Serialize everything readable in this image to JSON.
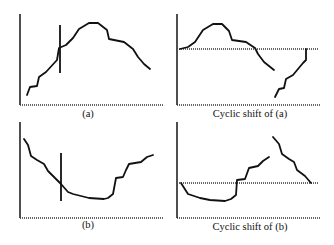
{
  "figure": {
    "panels": [
      {
        "id": "a",
        "caption": "(a)",
        "axes": {
          "x0": 20,
          "y_top": 14,
          "y_bottom": 105,
          "x_end": 163
        },
        "curves": [
          [
            [
              27,
              95
            ],
            [
              30,
              87
            ],
            [
              37,
              86
            ],
            [
              39,
              77
            ],
            [
              46,
              72
            ],
            [
              57,
              60
            ],
            [
              59,
              48
            ],
            [
              66,
              45
            ],
            [
              73,
              38
            ],
            [
              79,
              29
            ],
            [
              89,
              23
            ],
            [
              98,
              23
            ],
            [
              107,
              30
            ],
            [
              109,
              39
            ],
            [
              124,
              42
            ],
            [
              133,
              49
            ],
            [
              138,
              57
            ],
            [
              144,
              64
            ],
            [
              150,
              69
            ]
          ]
        ],
        "marker": {
          "x": 60,
          "y1": 25,
          "y2": 73
        },
        "reference_line": null,
        "caption_pos": {
          "x": 88,
          "y": 117
        }
      },
      {
        "id": "shift_a",
        "caption": "Cyclic shift of (a)",
        "axes": {
          "x0": 177,
          "y_top": 14,
          "y_bottom": 105,
          "x_end": 320
        },
        "curves": [
          [
            [
              180,
              49
            ],
            [
              188,
              47
            ],
            [
              195,
              42
            ],
            [
              203,
              30
            ],
            [
              213,
              24
            ],
            [
              222,
              24
            ],
            [
              229,
              31
            ],
            [
              232,
              40
            ],
            [
              246,
              42
            ],
            [
              255,
              48
            ],
            [
              258,
              54
            ],
            [
              264,
              62
            ],
            [
              274,
              70
            ]
          ],
          [
            [
              275,
              97
            ],
            [
              279,
              89
            ],
            [
              284,
              88
            ],
            [
              286,
              79
            ],
            [
              293,
              75
            ],
            [
              303,
              63
            ],
            [
              306,
              60
            ],
            [
              306,
              49
            ]
          ]
        ],
        "marker": null,
        "reference_line": {
          "y": 49,
          "x1": 179,
          "x2": 318
        },
        "caption_pos": {
          "x": 250,
          "y": 117
        }
      },
      {
        "id": "b",
        "caption": "(b)",
        "axes": {
          "x0": 20,
          "y_top": 122,
          "y_bottom": 218,
          "x_end": 163
        },
        "curves": [
          [
            [
              24,
              139
            ],
            [
              28,
              145
            ],
            [
              31,
              156
            ],
            [
              37,
              160
            ],
            [
              44,
              164
            ],
            [
              48,
              171
            ],
            [
              55,
              178
            ],
            [
              61,
              184
            ],
            [
              68,
              192
            ],
            [
              73,
              194
            ],
            [
              89,
              198
            ],
            [
              104,
              199
            ],
            [
              108,
              198
            ],
            [
              113,
              194
            ],
            [
              116,
              178
            ],
            [
              123,
              177
            ],
            [
              126,
              170
            ],
            [
              129,
              164
            ],
            [
              141,
              162
            ],
            [
              147,
              157
            ],
            [
              153,
              155
            ]
          ]
        ],
        "marker": {
          "x": 61,
          "y1": 153,
          "y2": 201
        },
        "reference_line": null,
        "caption_pos": {
          "x": 88,
          "y": 228
        }
      },
      {
        "id": "shift_b",
        "caption": "Cyclic shift of (b)",
        "axes": {
          "x0": 177,
          "y_top": 122,
          "y_bottom": 218,
          "x_end": 320
        },
        "curves": [
          [
            [
              181,
              183
            ],
            [
              188,
              194
            ],
            [
              200,
              198
            ],
            [
              210,
              200
            ],
            [
              225,
              201
            ],
            [
              231,
              199
            ],
            [
              236,
              195
            ],
            [
              237,
              180
            ],
            [
              245,
              179
            ],
            [
              249,
              168
            ],
            [
              258,
              166
            ],
            [
              263,
              161
            ],
            [
              269,
              157
            ]
          ],
          [
            [
              273,
              137
            ],
            [
              279,
              144
            ],
            [
              282,
              154
            ],
            [
              289,
              159
            ],
            [
              294,
              162
            ],
            [
              297,
              170
            ],
            [
              305,
              176
            ],
            [
              311,
              183
            ]
          ]
        ],
        "marker": null,
        "reference_line": {
          "y": 183,
          "x1": 179,
          "x2": 318
        },
        "caption_pos": {
          "x": 250,
          "y": 230
        }
      }
    ],
    "colors": {
      "stroke": "#111111",
      "axis": "#222222",
      "dotted": "#333333",
      "background": "#ffffff"
    }
  }
}
